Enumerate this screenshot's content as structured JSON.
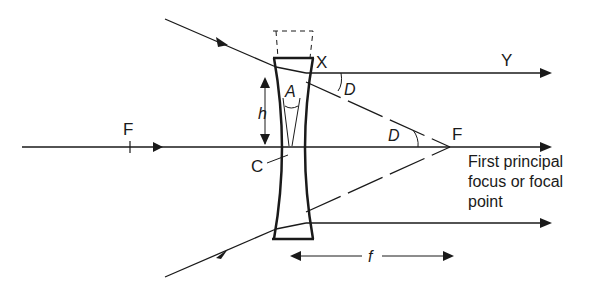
{
  "diagram": {
    "colors": {
      "ink": "#1a1a1a",
      "background": "#ffffff"
    },
    "labels": {
      "focus_left": "F",
      "focus_right": "F",
      "point_x": "X",
      "point_y": "Y",
      "angle_a": "A",
      "angle_d_top": "D",
      "angle_d_axis": "D",
      "height": "h",
      "center": "C",
      "focal_length": "f",
      "focus_caption_line1": "First principal",
      "focus_caption_line2": "focus or focal",
      "focus_caption_line3": "point"
    }
  }
}
